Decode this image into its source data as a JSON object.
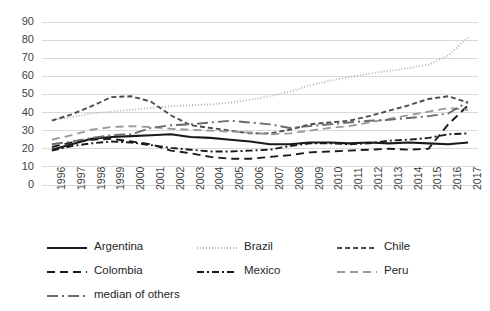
{
  "chart_data": {
    "type": "line",
    "title": "",
    "xlabel": "",
    "ylabel": "",
    "grid": true,
    "legend_position": "bottom",
    "ylim": [
      0,
      90
    ],
    "yticks": [
      0,
      10,
      20,
      30,
      40,
      50,
      60,
      70,
      80,
      90
    ],
    "categories": [
      "1996",
      "1997",
      "1998",
      "1999",
      "2000",
      "2001",
      "2002",
      "2003",
      "2004",
      "2005",
      "2006",
      "2007",
      "2008",
      "2009",
      "2010",
      "2011",
      "2012",
      "2013",
      "2014",
      "2015",
      "2016",
      "2017"
    ],
    "series": [
      {
        "name": "Argentina",
        "style": "solid",
        "color": "#1a1a1a",
        "values": [
          19.5,
          22.5,
          25.5,
          26.5,
          27.0,
          27.5,
          28.0,
          26.5,
          26.0,
          25.0,
          24.0,
          22.5,
          22.5,
          23.5,
          23.5,
          23.0,
          23.5,
          23.0,
          23.5,
          23.0,
          22.5,
          23.5
        ]
      },
      {
        "name": "Brazil",
        "style": "dotted",
        "color": "#b3b3b3",
        "values": [
          36.0,
          37.5,
          39.5,
          40.5,
          41.5,
          42.5,
          43.5,
          44.0,
          44.5,
          45.5,
          47.0,
          49.0,
          51.5,
          55.0,
          57.5,
          59.5,
          61.5,
          63.0,
          64.5,
          66.5,
          71.5,
          81.5
        ]
      },
      {
        "name": "Chile",
        "style": "dashed",
        "color": "#4d4d4d",
        "values": [
          35.5,
          39.0,
          43.5,
          48.5,
          49.0,
          46.0,
          38.5,
          33.0,
          31.5,
          30.0,
          28.5,
          28.5,
          30.5,
          33.5,
          34.5,
          35.5,
          38.0,
          41.0,
          44.0,
          47.5,
          49.0,
          45.5
        ]
      },
      {
        "name": "Colombia",
        "style": "dashed-long",
        "color": "#1a1a1a",
        "values": [
          21.0,
          23.5,
          25.0,
          25.5,
          24.0,
          22.5,
          19.0,
          17.5,
          15.5,
          14.5,
          14.5,
          15.5,
          16.5,
          18.0,
          18.5,
          19.0,
          19.5,
          20.0,
          19.5,
          20.0,
          33.5,
          44.0
        ]
      },
      {
        "name": "Mexico",
        "style": "dash-dot",
        "color": "#1a1a1a",
        "values": [
          19.0,
          21.5,
          23.0,
          24.0,
          23.5,
          22.0,
          20.5,
          19.5,
          18.5,
          18.5,
          19.0,
          19.5,
          21.5,
          23.0,
          23.0,
          22.5,
          23.0,
          24.5,
          25.0,
          26.0,
          28.0,
          28.5
        ]
      },
      {
        "name": "Peru",
        "style": "dashed-long",
        "color": "#9a9a9a",
        "values": [
          25.0,
          27.5,
          30.5,
          32.0,
          32.5,
          32.0,
          31.0,
          30.5,
          30.0,
          29.5,
          29.0,
          28.0,
          28.5,
          30.0,
          31.5,
          32.5,
          34.5,
          36.5,
          38.5,
          40.5,
          42.5,
          41.5
        ]
      },
      {
        "name": "median of others",
        "style": "long-dash-dot",
        "color": "#6b6b6b",
        "values": [
          22.5,
          24.0,
          26.0,
          27.5,
          28.0,
          31.5,
          33.0,
          33.5,
          34.5,
          35.5,
          34.5,
          33.5,
          31.5,
          32.5,
          33.5,
          34.5,
          35.5,
          36.0,
          37.0,
          38.0,
          39.5,
          46.0
        ]
      }
    ]
  },
  "legend": {
    "items": [
      {
        "label": "Argentina"
      },
      {
        "label": "Brazil"
      },
      {
        "label": "Chile"
      },
      {
        "label": "Colombia"
      },
      {
        "label": "Mexico"
      },
      {
        "label": "Peru"
      },
      {
        "label": "median of others"
      }
    ]
  }
}
